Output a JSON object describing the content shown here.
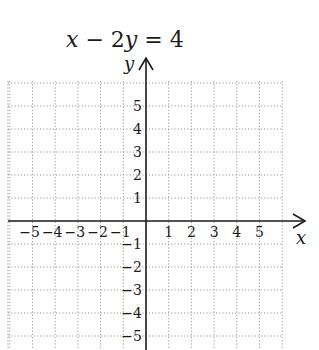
{
  "title": {
    "parts": [
      {
        "text": "x",
        "italic": true
      },
      {
        "text": " − 2",
        "italic": false
      },
      {
        "text": "y",
        "italic": true
      },
      {
        "text": " = 4",
        "italic": false
      }
    ]
  },
  "chart_data": {
    "type": "line",
    "title": "x − 2y = 4",
    "xlabel": "x",
    "ylabel": "y",
    "xlim": [
      -6,
      6
    ],
    "ylim": [
      -5.5,
      6
    ],
    "grid": true,
    "grid_style": "dotted",
    "x_ticks": [
      -5,
      -4,
      -3,
      -2,
      -1,
      1,
      2,
      3,
      4,
      5
    ],
    "y_ticks": [
      5,
      4,
      3,
      2,
      1,
      -1,
      -2,
      -3,
      -4,
      -5
    ],
    "x_tick_labels": [
      "−5",
      "−4",
      "−3",
      "−2",
      "−1",
      "1",
      "2",
      "3",
      "4",
      "5"
    ],
    "y_tick_labels": [
      "5",
      "4",
      "3",
      "2",
      "1",
      "−1",
      "−2",
      "−3",
      "−4",
      "−5"
    ],
    "series": [],
    "note": "Blank coordinate grid for graphing the equation; no line plotted"
  },
  "colors": {
    "axis": "#1a1a1a",
    "grid": "#9a9a9a",
    "background": "#ffffff"
  }
}
